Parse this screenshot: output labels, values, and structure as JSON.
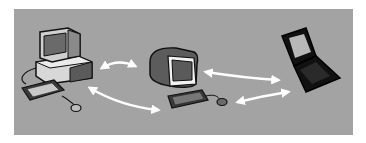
{
  "diagram": {
    "title": "",
    "background_color": "#a3a3a3",
    "nodes": [
      {
        "id": "desktop",
        "label": "",
        "type": "desktop-computer"
      },
      {
        "id": "terminal",
        "label": "",
        "type": "terminal-computer"
      },
      {
        "id": "laptop",
        "label": "",
        "type": "laptop-computer"
      }
    ],
    "edges": [
      {
        "from": "desktop",
        "to": "terminal",
        "direction": "bidirectional",
        "style": "upper-arrow"
      },
      {
        "from": "desktop",
        "to": "terminal",
        "direction": "bidirectional",
        "style": "lower-arrow"
      },
      {
        "from": "terminal",
        "to": "laptop",
        "direction": "bidirectional",
        "style": "upper-arrow"
      },
      {
        "from": "terminal",
        "to": "laptop",
        "direction": "bidirectional",
        "style": "lower-arrow"
      }
    ],
    "arrow_color": "#ffffff"
  }
}
